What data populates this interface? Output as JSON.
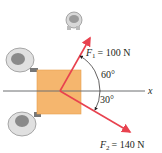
{
  "diagram": {
    "forces": [
      {
        "name": "F1",
        "symbol": "F",
        "subscript": "1",
        "equals": "= 100 N",
        "angle_label": "60°",
        "color": "#e8424f"
      },
      {
        "name": "F2",
        "symbol": "F",
        "subscript": "2",
        "equals": "= 140 N",
        "angle_label": "30°",
        "color": "#e8424f"
      }
    ],
    "axis_label": "x",
    "box_color": "#f5b66e"
  }
}
